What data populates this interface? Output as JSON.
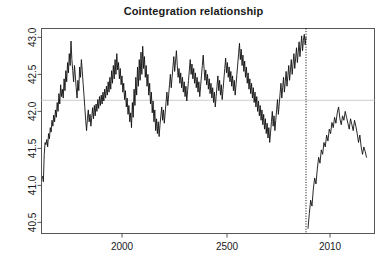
{
  "chart_data": {
    "type": "line",
    "title": "Cointegration relationship",
    "xlabel": "",
    "ylabel": "",
    "xlim": [
      1825,
      2013.5
    ],
    "ylim": [
      40.35,
      43.12
    ],
    "grid": false,
    "legend": null,
    "y_ticks": [
      40.5,
      41.0,
      41.5,
      42.0,
      42.5,
      43.0
    ],
    "y_tick_labels": [
      "40.5",
      "41.0",
      "41.5",
      "42.0",
      "42.5",
      "43.0"
    ],
    "x_ticks": [
      2000,
      2500,
      2010
    ],
    "x_tick_labels": [
      "2000",
      "2500",
      "2010"
    ],
    "x_tick_positions": [
      122,
      227,
      330
    ],
    "annotations": [
      {
        "name": "structural-break-line",
        "type": "vline",
        "x_pixel": 306,
        "style": "dotted",
        "color": "#000000"
      },
      {
        "name": "mean-reference-line",
        "type": "hline",
        "y": 42.15,
        "style": "solid",
        "color": "#cccccc"
      }
    ],
    "series": [
      {
        "name": "cointegration-residual-pre-break",
        "color": "#111111",
        "values": [
          41.12,
          41.05,
          41.42,
          41.58,
          41.55,
          41.62,
          41.52,
          41.7,
          41.63,
          41.78,
          41.72,
          41.88,
          41.8,
          41.95,
          41.86,
          42.02,
          41.92,
          42.12,
          42.0,
          42.24,
          42.1,
          42.36,
          42.2,
          42.3,
          42.18,
          42.44,
          42.28,
          42.55,
          42.4,
          42.66,
          42.52,
          42.78,
          42.62,
          42.95,
          42.7,
          42.55,
          42.4,
          42.62,
          42.48,
          42.32,
          42.18,
          42.42,
          42.28,
          42.6,
          42.46,
          42.7,
          42.55,
          42.38,
          42.22,
          42.05,
          41.88,
          41.74,
          41.9,
          42.02,
          41.86,
          41.96,
          41.8,
          41.92,
          42.05,
          41.9,
          42.08,
          41.94,
          42.1,
          42.0,
          42.16,
          42.04,
          42.2,
          42.08,
          42.22,
          42.1,
          42.26,
          42.14,
          42.3,
          42.18,
          42.34,
          42.22,
          42.4,
          42.26,
          42.46,
          42.3,
          42.55,
          42.38,
          42.62,
          42.44,
          42.7,
          42.5,
          42.78,
          42.56,
          42.66,
          42.44,
          42.58,
          42.36,
          42.48,
          42.26,
          42.38,
          42.16,
          42.28,
          42.06,
          42.18,
          41.96,
          42.08,
          41.86,
          41.98,
          41.78,
          42.12,
          41.92,
          42.3,
          42.08,
          42.46,
          42.22,
          42.6,
          42.34,
          42.7,
          42.42,
          42.8,
          42.5,
          42.88,
          42.58,
          42.74,
          42.46,
          42.62,
          42.34,
          42.5,
          42.22,
          42.38,
          42.1,
          42.26,
          41.98,
          42.14,
          41.86,
          42.02,
          41.74,
          41.9,
          41.7,
          41.86,
          41.66,
          41.82,
          41.94,
          42.06,
          41.88,
          42.02,
          41.84,
          41.98,
          42.12,
          42.26,
          42.08,
          42.22,
          42.36,
          42.5,
          42.32,
          42.46,
          42.6,
          42.74,
          42.54,
          42.68,
          42.82,
          42.62,
          42.46,
          42.58,
          42.38,
          42.52,
          42.32,
          42.46,
          42.26,
          42.4,
          42.2,
          42.34,
          42.14,
          42.28,
          42.42,
          42.56,
          42.7,
          42.5,
          42.64,
          42.44,
          42.58,
          42.38,
          42.52,
          42.32,
          42.46,
          42.26,
          42.4,
          42.2,
          42.34,
          42.48,
          42.62,
          42.76,
          42.58,
          42.42,
          42.56,
          42.36,
          42.5,
          42.3,
          42.44,
          42.24,
          42.38,
          42.18,
          42.32,
          42.12,
          42.26,
          42.06,
          42.2,
          42.34,
          42.48,
          42.28,
          42.42,
          42.22,
          42.36,
          42.16,
          42.3,
          42.44,
          42.58,
          42.72,
          42.52,
          42.66,
          42.46,
          42.6,
          42.4,
          42.54,
          42.34,
          42.48,
          42.28,
          42.42,
          42.22,
          42.36,
          42.5,
          42.64,
          42.78,
          42.92,
          42.7,
          42.84,
          42.62,
          42.76,
          42.54,
          42.68,
          42.46,
          42.6,
          42.38,
          42.52,
          42.3,
          42.44,
          42.24,
          42.38,
          42.18,
          42.32,
          42.12,
          42.26,
          42.06,
          42.2,
          42.0,
          42.14,
          41.94,
          42.08,
          41.88,
          42.02,
          41.82,
          41.96,
          41.76,
          41.9,
          41.7,
          41.84,
          41.64,
          41.78,
          41.58,
          41.72,
          41.86,
          42.0,
          41.8,
          41.94,
          41.74,
          41.88,
          42.02,
          42.16,
          41.96,
          42.1,
          42.24,
          42.38,
          42.18,
          42.32,
          42.46,
          42.26,
          42.4,
          42.54,
          42.34,
          42.48,
          42.62,
          42.42,
          42.56,
          42.7,
          42.5,
          42.64,
          42.78,
          42.58,
          42.72,
          42.86,
          42.66,
          42.8,
          42.94,
          42.74,
          42.88,
          43.02,
          42.82,
          42.96,
          43.04,
          42.9,
          43.0
        ]
      },
      {
        "name": "cointegration-residual-post-break",
        "color": "#111111",
        "values": [
          40.42,
          40.62,
          40.8,
          40.72,
          40.95,
          41.1,
          41.02,
          41.22,
          41.38,
          41.3,
          41.48,
          41.42,
          41.58,
          41.52,
          41.68,
          41.6,
          41.76,
          41.7,
          41.85,
          41.78,
          41.92,
          41.84,
          41.98,
          42.06,
          41.9,
          41.82,
          41.94,
          41.88,
          42.0,
          41.92,
          41.84,
          41.76,
          41.9,
          41.82,
          41.74,
          41.88,
          41.8,
          41.7,
          41.58,
          41.68,
          41.52,
          41.42,
          41.52,
          41.46,
          41.38
        ]
      }
    ]
  }
}
